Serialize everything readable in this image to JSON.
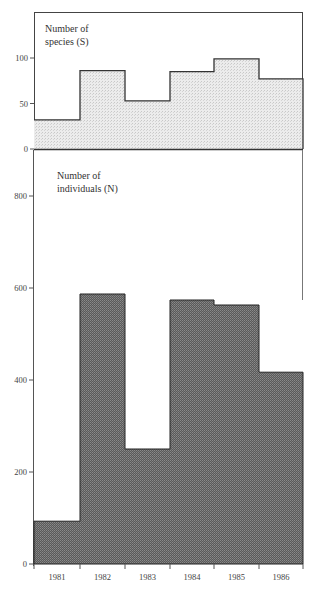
{
  "chart_data": [
    {
      "type": "bar",
      "style": "step-histogram",
      "title": "Number of species (S)",
      "title_lines": [
        "Number of",
        "species (S)"
      ],
      "categories": [
        "1981",
        "1982",
        "1983",
        "1984",
        "1985",
        "1986"
      ],
      "values": [
        32,
        86,
        53,
        85,
        99,
        77
      ],
      "xlabel": "",
      "ylabel": "",
      "ylim": [
        0,
        100
      ],
      "yticks": [
        0,
        50,
        100
      ],
      "grid": false,
      "fill_color": "#e4e4e4",
      "line_color": "#333333"
    },
    {
      "type": "bar",
      "style": "step-histogram",
      "title": "Number of individuals (N)",
      "title_lines": [
        "Number of",
        "individuals (N)"
      ],
      "categories": [
        "1981",
        "1982",
        "1983",
        "1984",
        "1985",
        "1986"
      ],
      "values": [
        93,
        587,
        250,
        574,
        563,
        417
      ],
      "xlabel": "",
      "ylabel": "",
      "ylim": [
        0,
        800
      ],
      "yticks": [
        0,
        200,
        400,
        600,
        800
      ],
      "grid": false,
      "fill_color": "#6e6e6e",
      "line_color": "#222222"
    }
  ]
}
